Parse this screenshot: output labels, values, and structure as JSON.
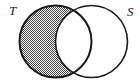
{
  "diagram": {
    "type": "venn",
    "sets": [
      {
        "id": "T",
        "label": "T"
      },
      {
        "id": "S",
        "label": "S"
      }
    ],
    "shaded_region": "T \\ S",
    "colors": {
      "stroke": "#1a1a1a",
      "shade": "#555555",
      "background": "#ffffff"
    }
  }
}
